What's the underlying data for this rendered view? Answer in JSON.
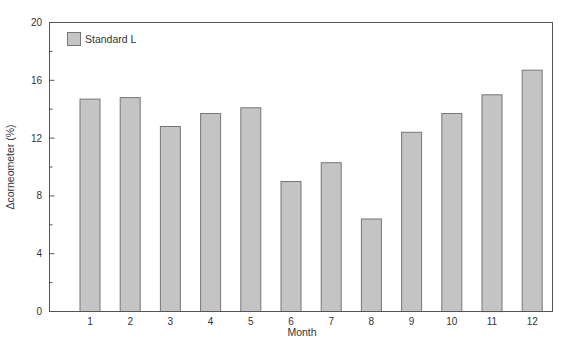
{
  "chart_data": {
    "type": "bar",
    "title": "",
    "xlabel": "Month",
    "ylabel": "Δcorneometer (%)",
    "categories": [
      "1",
      "2",
      "3",
      "4",
      "5",
      "6",
      "7",
      "8",
      "9",
      "10",
      "11",
      "12"
    ],
    "series": [
      {
        "name": "Standard L",
        "values": [
          14.7,
          14.8,
          12.8,
          13.7,
          14.1,
          9.0,
          10.3,
          6.4,
          12.4,
          13.7,
          15.0,
          16.7
        ],
        "color": "#c4c4c4",
        "edge_color": "#777777"
      }
    ],
    "ylim": [
      0,
      20
    ],
    "yticks": [
      0,
      4,
      8,
      12,
      16,
      20
    ],
    "minor_yticks": [
      2,
      6,
      10,
      14,
      18
    ],
    "grid": false,
    "legend_position": "upper left"
  }
}
